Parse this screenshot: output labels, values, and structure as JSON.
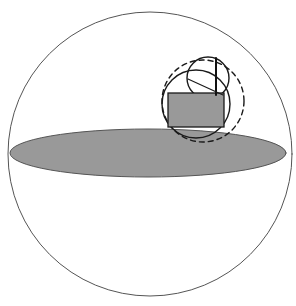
{
  "canvas": {
    "width": 296,
    "height": 306,
    "background": "#ffffff"
  },
  "figure": {
    "stroke_color": "#444444",
    "fill_gray": "#999999",
    "line_color_dark": "#1a1a1a"
  },
  "chart_data": {
    "type": "diagram",
    "shapes": [
      {
        "name": "outer-sphere-circle",
        "kind": "circle",
        "cx": 150,
        "cy": 154,
        "r": 142,
        "fill": "none",
        "stroke": "#555555",
        "stroke_width": 1,
        "dashed": false
      },
      {
        "name": "equatorial-disk-ellipse",
        "kind": "ellipse",
        "cx": 148,
        "cy": 153,
        "rx": 138,
        "ry": 24,
        "fill": "#999999",
        "stroke": "#555555",
        "stroke_width": 1,
        "dashed": false
      },
      {
        "name": "dashed-construction-circle",
        "kind": "circle",
        "cx": 203,
        "cy": 101,
        "r": 41,
        "fill": "none",
        "stroke": "#1a1a1a",
        "stroke_width": 1.4,
        "dashed": true,
        "dash_pattern": "5 4"
      },
      {
        "name": "inner-solid-circle",
        "kind": "circle",
        "cx": 196,
        "cy": 104,
        "r": 34,
        "fill": "none",
        "stroke": "#1a1a1a",
        "stroke_width": 1.4,
        "dashed": false
      },
      {
        "name": "small-top-circle",
        "kind": "circle",
        "cx": 208,
        "cy": 78,
        "r": 21,
        "fill": "none",
        "stroke": "#1a1a1a",
        "stroke_width": 1.4,
        "dashed": false
      },
      {
        "name": "inscribed-rectangle",
        "kind": "rect",
        "x": 168,
        "y": 93,
        "width": 56,
        "height": 34,
        "fill": "#999999",
        "stroke": "#1a1a1a",
        "stroke_width": 1.3,
        "dashed": false
      },
      {
        "name": "vertical-chord-line",
        "kind": "line",
        "x1": 216,
        "y1": 58,
        "x2": 216,
        "y2": 95,
        "stroke": "#111111",
        "stroke_width": 2
      },
      {
        "name": "diagonal-chord-line",
        "kind": "line",
        "x1": 188,
        "y1": 79,
        "x2": 223,
        "y2": 95,
        "stroke": "#1a1a1a",
        "stroke_width": 1.2
      }
    ],
    "xlabel": "",
    "ylabel": "",
    "legend": [],
    "grid": false
  }
}
